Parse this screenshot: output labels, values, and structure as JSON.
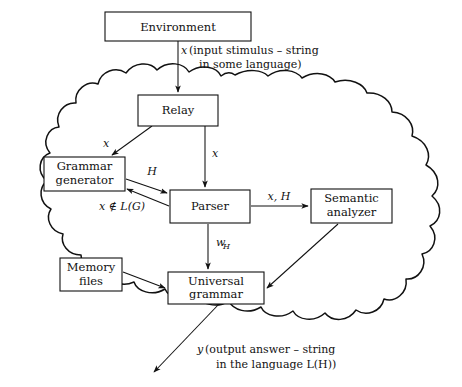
{
  "diagram": {
    "colors": {
      "stroke": "#111111",
      "background": "#ffffff",
      "box_fill": "#ffffff"
    },
    "boundary": {
      "name": "cloud-boundary",
      "shape": "cloud"
    },
    "nodes": [
      {
        "id": "environment",
        "label": "Environment",
        "label2": "",
        "x": 105,
        "y": 12,
        "w": 146,
        "h": 29
      },
      {
        "id": "relay",
        "label": "Relay",
        "label2": "",
        "x": 138,
        "y": 95,
        "w": 80,
        "h": 31
      },
      {
        "id": "grammar-generator",
        "label": "Grammar",
        "label2": "generator",
        "x": 44,
        "y": 157,
        "w": 81,
        "h": 34
      },
      {
        "id": "parser",
        "label": "Parser",
        "label2": "",
        "x": 170,
        "y": 190,
        "w": 80,
        "h": 33
      },
      {
        "id": "semantic-analyzer",
        "label": "Semantic",
        "label2": "analyzer",
        "x": 311,
        "y": 189,
        "w": 81,
        "h": 34
      },
      {
        "id": "memory-files",
        "label": "Memory",
        "label2": "files",
        "x": 60,
        "y": 258,
        "w": 62,
        "h": 33
      },
      {
        "id": "universal-grammar",
        "label": "Universal",
        "label2": "grammar",
        "x": 168,
        "y": 272,
        "w": 96,
        "h": 32
      }
    ],
    "edges": [
      {
        "id": "environment-to-relay",
        "from": "environment",
        "to": "relay",
        "label": "x"
      },
      {
        "id": "relay-to-grammar-generator",
        "from": "relay",
        "to": "grammar-generator",
        "label": "x"
      },
      {
        "id": "relay-to-parser",
        "from": "relay",
        "to": "parser",
        "label": "x"
      },
      {
        "id": "grammar-generator-to-parser",
        "from": "grammar-generator",
        "to": "parser",
        "label": "H"
      },
      {
        "id": "parser-to-grammar-generator",
        "from": "parser",
        "to": "grammar-generator",
        "label": "x ∉ L(G)"
      },
      {
        "id": "parser-to-semantic-analyzer",
        "from": "parser",
        "to": "semantic-analyzer",
        "label": "x, H"
      },
      {
        "id": "parser-to-universal-grammar",
        "from": "parser",
        "to": "universal-grammar",
        "label": "wH"
      },
      {
        "id": "memory-files-to-universal-grammar",
        "from": "memory-files",
        "to": "universal-grammar",
        "label": ""
      },
      {
        "id": "semantic-analyzer-to-universal-grammar",
        "from": "semantic-analyzer",
        "to": "universal-grammar",
        "label": ""
      },
      {
        "id": "universal-grammar-output",
        "from": "universal-grammar",
        "to": "output",
        "label": "y"
      }
    ],
    "edge_labels": {
      "input_x": "x",
      "relay_to_grammar_x": "x",
      "relay_to_parser_x": "x",
      "grammar_to_parser_H": "H",
      "parser_to_grammar_reject": "x ∉ L(G)",
      "parser_to_semantic": "x, H",
      "parser_to_universal_w": "w",
      "parser_to_universal_w_sub": "H"
    },
    "annotations": {
      "input": {
        "var": "x",
        "line1": "(input stimulus – string",
        "line2": "in some language)"
      },
      "output": {
        "var": "y",
        "line1": "(output answer – string",
        "line2": "in the language L(H))"
      }
    }
  }
}
